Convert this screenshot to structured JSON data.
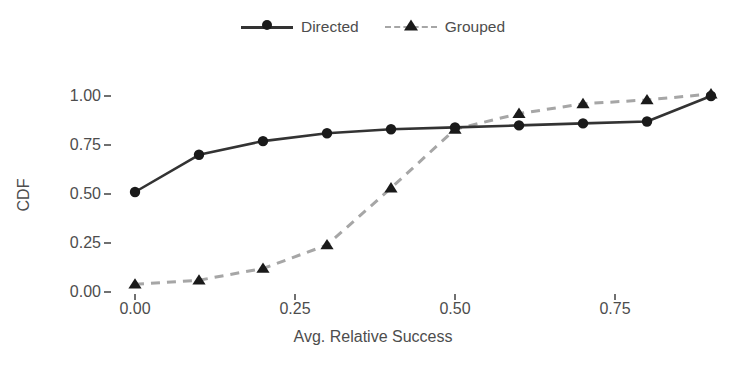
{
  "chart_data": {
    "type": "line",
    "title": "",
    "subtitle": "",
    "xlabel": "Avg. Relative Success",
    "ylabel": "CDF",
    "xlim": [
      -0.03,
      0.93
    ],
    "ylim": [
      -0.02,
      1.06
    ],
    "grid": false,
    "legend_position": "top-center",
    "xticks": [
      0.0,
      0.25,
      0.5,
      0.75
    ],
    "xtick_labels": [
      "0.00",
      "0.25",
      "0.50",
      "0.75"
    ],
    "yticks": [
      0.0,
      0.25,
      0.5,
      0.75,
      1.0
    ],
    "ytick_labels": [
      "0.00",
      "0.25",
      "0.50",
      "0.75",
      "1.00"
    ],
    "x": [
      0.0,
      0.1,
      0.2,
      0.3,
      0.4,
      0.5,
      0.6,
      0.7,
      0.8,
      0.9
    ],
    "series": [
      {
        "name": "Directed",
        "marker": "circle",
        "linestyle": "solid",
        "color": "#333333",
        "values": [
          0.51,
          0.7,
          0.77,
          0.81,
          0.83,
          0.84,
          0.85,
          0.86,
          0.87,
          1.0
        ]
      },
      {
        "name": "Grouped",
        "marker": "triangle",
        "linestyle": "dashed",
        "color": "#a6a6a6",
        "marker_color": "#1a1a1a",
        "values": [
          0.04,
          0.06,
          0.12,
          0.24,
          0.53,
          0.83,
          0.91,
          0.96,
          0.98,
          1.01
        ]
      }
    ]
  },
  "legend": {
    "entries": [
      {
        "label": "Directed",
        "icon": "circle-marker-icon"
      },
      {
        "label": "Grouped",
        "icon": "triangle-marker-icon"
      }
    ]
  },
  "axes": {
    "x_label": "Avg. Relative Success",
    "y_label": "CDF"
  },
  "colors": {
    "directed_line": "#333333",
    "grouped_line": "#a6a6a6",
    "marker_fill": "#1a1a1a",
    "text": "#4d4d4d",
    "background": "#ffffff"
  }
}
